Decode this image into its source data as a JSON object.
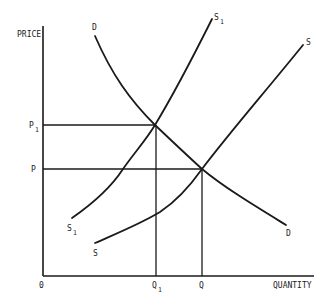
{
  "diagram": {
    "axes": {
      "y_label": "PRICE",
      "x_label": "QUANTITY",
      "origin_label": "0"
    },
    "price_levels": [
      {
        "label": "P",
        "subscript": "1"
      },
      {
        "label": "P",
        "subscript": ""
      }
    ],
    "quantity_levels": [
      {
        "label": "Q",
        "subscript": "1"
      },
      {
        "label": "Q",
        "subscript": ""
      }
    ],
    "curves": {
      "demand": {
        "label_top": "D",
        "label_bottom": "D"
      },
      "supply_shifted": {
        "label": "S",
        "subscript": "1"
      },
      "supply": {
        "label": "S"
      }
    },
    "colors": {
      "line": "#1a1a1a",
      "background": "#ffffff"
    }
  }
}
